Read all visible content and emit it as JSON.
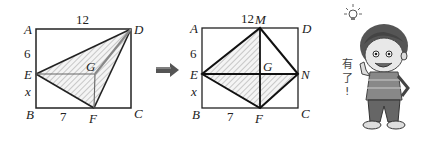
{
  "figure1": {
    "labels": {
      "A": "A",
      "B": "B",
      "C": "C",
      "D": "D",
      "E": "E",
      "F": "F",
      "G": "G"
    },
    "measures": {
      "top": "12",
      "AE": "6",
      "EB": "x",
      "BF": "7"
    }
  },
  "arrow": {
    "icon": "right-arrow-icon"
  },
  "figure2": {
    "labels": {
      "A": "A",
      "B": "B",
      "C": "C",
      "D": "D",
      "E": "E",
      "F": "F",
      "G": "G",
      "M": "M",
      "N": "N"
    },
    "measures": {
      "top": "12",
      "AE": "6",
      "EB": "x",
      "BF": "7"
    }
  },
  "character": {
    "speech": [
      "有",
      "了",
      "!"
    ],
    "icon": "lightbulb-icon"
  }
}
